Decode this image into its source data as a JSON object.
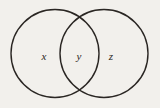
{
  "figure": {
    "type": "venn-diagram",
    "background_color": "#f2f0ec",
    "stroke_color": "#2a2623",
    "fill_color": "none",
    "stroke_width": 1.4,
    "width": 160,
    "height": 108
  },
  "circles": [
    {
      "name": "left-circle",
      "cx": 55,
      "cy": 53.5,
      "r": 44
    },
    {
      "name": "right-circle",
      "cx": 104,
      "cy": 53.5,
      "r": 44
    }
  ],
  "intersection": {
    "name": "lens-region",
    "top_crossing": {
      "x": 80,
      "y": 13
    },
    "bottom_crossing": {
      "x": 80,
      "y": 94
    }
  },
  "labels": {
    "left": "x",
    "middle": "y",
    "right": "z"
  },
  "label_positions": {
    "left": {
      "x": 44,
      "y": 56
    },
    "middle": {
      "x": 79,
      "y": 56
    },
    "right": {
      "x": 111,
      "y": 56
    }
  }
}
